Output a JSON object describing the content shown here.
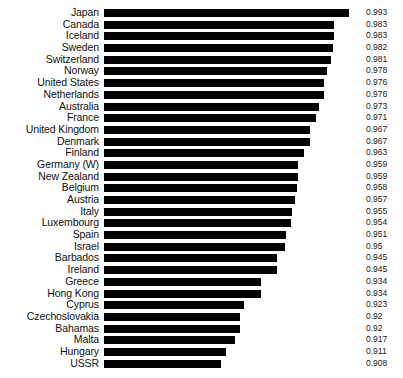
{
  "chart_data": {
    "type": "bar",
    "orientation": "horizontal",
    "title": "",
    "subtitle": "",
    "xlabel": "",
    "ylabel": "",
    "grid": false,
    "legend": false,
    "value_labels": true,
    "value_label_position": "outside-right",
    "bar_color": "#000000",
    "background_color": "#ffffff",
    "xlim": [
      0.83,
      1.0
    ],
    "axis_baseline": 0.83,
    "categories": [
      "Japan",
      "Canada",
      "Iceland",
      "Sweden",
      "Switzerland",
      "Norway",
      "United States",
      "Netherlands",
      "Australia",
      "France",
      "United Kingdom",
      "Denmark",
      "Finland",
      "Germany (W)",
      "New Zealand",
      "Belgium",
      "Austria",
      "Italy",
      "Luxembourg",
      "Spain",
      "Israel",
      "Barbados",
      "Ireland",
      "Greece",
      "Hong Kong",
      "Cyprus",
      "Czechoslovakia",
      "Bahamas",
      "Malta",
      "Hungary",
      "USSR"
    ],
    "values": [
      0.993,
      0.983,
      0.983,
      0.982,
      0.981,
      0.978,
      0.976,
      0.976,
      0.973,
      0.971,
      0.967,
      0.967,
      0.963,
      0.959,
      0.959,
      0.958,
      0.957,
      0.955,
      0.954,
      0.951,
      0.95,
      0.945,
      0.945,
      0.934,
      0.934,
      0.923,
      0.92,
      0.92,
      0.917,
      0.911,
      0.908
    ],
    "value_labels_text": [
      "0.993",
      "0.983",
      "0.983",
      "0.982",
      "0.981",
      "0.978",
      "0.976",
      "0.976",
      "0.973",
      "0.971",
      "0.967",
      "0.967",
      "0.963",
      "0.959",
      "0.959",
      "0.958",
      "0.957",
      "0.955",
      "0.954",
      "0.951",
      "0.95",
      "0.945",
      "0.945",
      "0.934",
      "0.934",
      "0.923",
      "0.92",
      "0.92",
      "0.917",
      "0.911",
      "0.908"
    ]
  }
}
